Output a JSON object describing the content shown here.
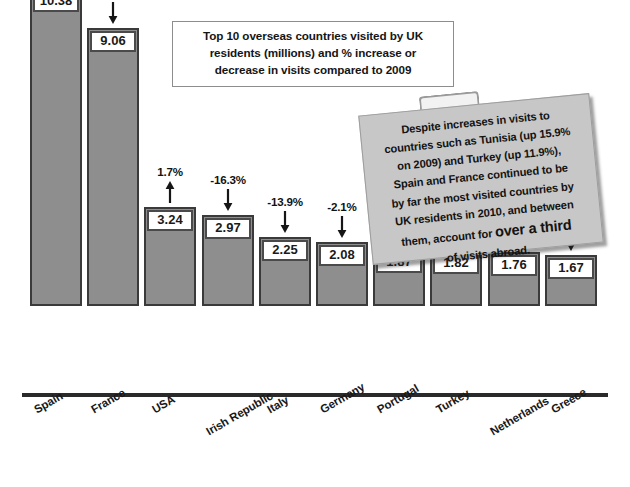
{
  "chart_data": {
    "type": "bar",
    "title": "Top 10 overseas countries visited by UK residents (millions) and % increase or decrease in visits compared to 2009",
    "title_lines": [
      "Top 10 overseas countries visited by UK",
      "residents (millions) and % increase or",
      "decrease in visits compared to 2009"
    ],
    "xlabel": "",
    "ylabel": "",
    "ylim": [
      0,
      11.5
    ],
    "grid": false,
    "legend": "none",
    "categories": [
      "Spain",
      "France",
      "USA",
      "Irish Republic",
      "Italy",
      "Germany",
      "Portugal",
      "Turkey",
      "Netherlands",
      "Greece"
    ],
    "values": [
      10.38,
      9.06,
      3.24,
      2.97,
      2.25,
      2.08,
      1.87,
      1.82,
      1.76,
      1.67
    ],
    "value_labels": [
      "10.38",
      "9.06",
      "3.24",
      "2.97",
      "2.25",
      "2.08",
      "1.87",
      "1.82",
      "1.76",
      "1.67"
    ],
    "pct_change": [
      -10.4,
      -7.2,
      1.7,
      -16.3,
      -13.9,
      -2.1,
      3.2,
      11.9,
      -4.5,
      -11.1
    ],
    "pct_labels": [
      "-10.4%",
      "-7.2%",
      "1.7%",
      "-16.3%",
      "-13.9%",
      "-2.1%",
      "3.2%",
      "11.9%",
      "-4.5%",
      "-11.1%"
    ],
    "arrow_directions": [
      "down",
      "down",
      "up",
      "down",
      "down",
      "down",
      "up",
      "up",
      "down",
      "down"
    ],
    "bar_color": "#8e8e8e",
    "bar_border_color": "#3a3a3a",
    "label_box_color": "#ffffff",
    "axis_color": "#2a2a2a"
  },
  "callout": {
    "lines": [
      "Despite increases in visits to",
      "countries such as Tunisia (up 15.9%",
      "on 2009) and Turkey (up 11.9%),",
      "Spain and France continued to be",
      "by far the most visited countries by",
      "UK residents in 2010, and between",
      "them, account for"
    ],
    "emphasis": "over a third",
    "last_line": "of visits abroad.",
    "background_color": "#c7c7c7"
  }
}
